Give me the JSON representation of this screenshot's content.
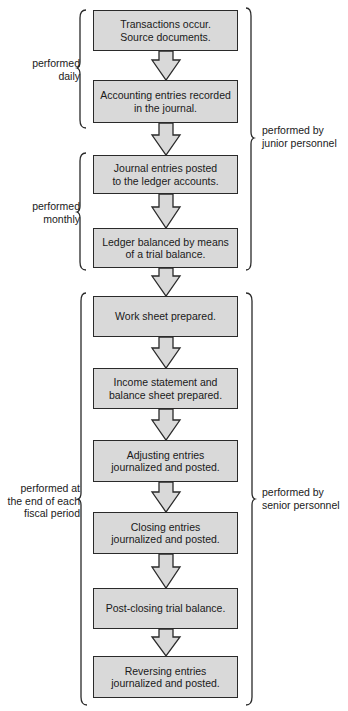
{
  "steps": [
    {
      "text": "Transactions occur.\nSource documents.",
      "top": 10,
      "height": 41
    },
    {
      "text": "Accounting entries recorded\nin the journal.",
      "top": 80,
      "height": 43
    },
    {
      "text": "Journal entries posted\nto the ledger accounts.",
      "top": 155,
      "height": 39
    },
    {
      "text": "Ledger balanced by means\nof a trial balance.",
      "top": 228,
      "height": 40
    },
    {
      "text": "Work sheet prepared.",
      "top": 296,
      "height": 41
    },
    {
      "text": "Income statement and\nbalance sheet prepared.",
      "top": 368,
      "height": 41
    },
    {
      "text": "Adjusting entries\njournalized and posted.",
      "top": 440,
      "height": 42
    },
    {
      "text": "Closing entries\njournalized and posted.",
      "top": 512,
      "height": 42
    },
    {
      "text": "Post-closing trial balance.",
      "top": 588,
      "height": 41
    },
    {
      "text": "Reversing entries\njournalized and posted.",
      "top": 656,
      "height": 42
    }
  ],
  "left_labels": [
    {
      "text": "performed\ndaily",
      "top": 57
    },
    {
      "text": "performed\nmonthly",
      "top": 200
    },
    {
      "text": "performed at\nthe end of each\nfiscal period",
      "top": 482
    }
  ],
  "right_labels": [
    {
      "text": "performed by\njunior personnel",
      "top": 124
    },
    {
      "text": "performed by\nsenior personnel",
      "top": 486
    }
  ],
  "colors": {
    "box_fill": "#d9d9d9",
    "stroke": "#2a2a2a"
  }
}
